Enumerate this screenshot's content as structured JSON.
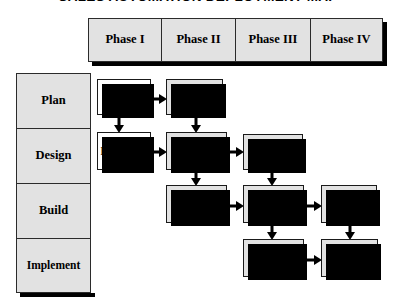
{
  "title": "SALES AUTOMATION DEPLOYMENT MAP",
  "colors": {
    "cell_fill": "#e2e2e2",
    "node_fill_gray": "#e2e2e2",
    "node_fill_white": "#ffffff",
    "border": "#1a1a1a",
    "shadow": "#000000",
    "text": "#000000"
  },
  "columns": [
    {
      "label": "Phase I"
    },
    {
      "label": "Phase II"
    },
    {
      "label": "Phase III"
    },
    {
      "label": "Phase IV"
    }
  ],
  "rows": [
    {
      "label": "Plan"
    },
    {
      "label": "Design"
    },
    {
      "label": "Build"
    },
    {
      "label": "Implement"
    }
  ],
  "nodes": [
    {
      "id": "input",
      "label": "Input",
      "row": "Plan",
      "column": "Phase I",
      "fill": "white"
    },
    {
      "id": "concept",
      "label": "Concept",
      "row": "Plan",
      "column": "Phase II",
      "fill": "gray"
    },
    {
      "id": "data-map",
      "label": "Data Map",
      "row": "Design",
      "column": "Phase I",
      "fill": "white"
    },
    {
      "id": "new-data-map",
      "label": "New Data Map",
      "row": "Design",
      "column": "Phase II",
      "fill": "gray"
    },
    {
      "id": "specs",
      "label": "Specs",
      "row": "Design",
      "column": "Phase III",
      "fill": "gray"
    },
    {
      "id": "functional-design",
      "label": "Functional Design",
      "row": "Build",
      "column": "Phase II",
      "fill": "gray"
    },
    {
      "id": "software-hardware",
      "label": "Software Hardware",
      "row": "Build",
      "column": "Phase III",
      "fill": "gray"
    },
    {
      "id": "custom-program",
      "label": "Custom Program",
      "row": "Build",
      "column": "Phase IV",
      "fill": "gray"
    },
    {
      "id": "beta",
      "label": "Beta",
      "row": "Implement",
      "column": "Phase III",
      "fill": "gray"
    },
    {
      "id": "roll-out",
      "label": "Roll-out",
      "row": "Implement",
      "column": "Phase IV",
      "fill": "gray"
    }
  ],
  "connections": [
    {
      "from": "input",
      "to": "concept",
      "direction": "right"
    },
    {
      "from": "input",
      "to": "data-map",
      "direction": "down"
    },
    {
      "from": "concept",
      "to": "new-data-map",
      "direction": "down"
    },
    {
      "from": "data-map",
      "to": "new-data-map",
      "direction": "right"
    },
    {
      "from": "new-data-map",
      "to": "specs",
      "direction": "right"
    },
    {
      "from": "new-data-map",
      "to": "functional-design",
      "direction": "down"
    },
    {
      "from": "specs",
      "to": "software-hardware",
      "direction": "down"
    },
    {
      "from": "functional-design",
      "to": "software-hardware",
      "direction": "right"
    },
    {
      "from": "software-hardware",
      "to": "custom-program",
      "direction": "right"
    },
    {
      "from": "software-hardware",
      "to": "beta",
      "direction": "down"
    },
    {
      "from": "custom-program",
      "to": "roll-out",
      "direction": "down"
    },
    {
      "from": "beta",
      "to": "roll-out",
      "direction": "right"
    }
  ]
}
